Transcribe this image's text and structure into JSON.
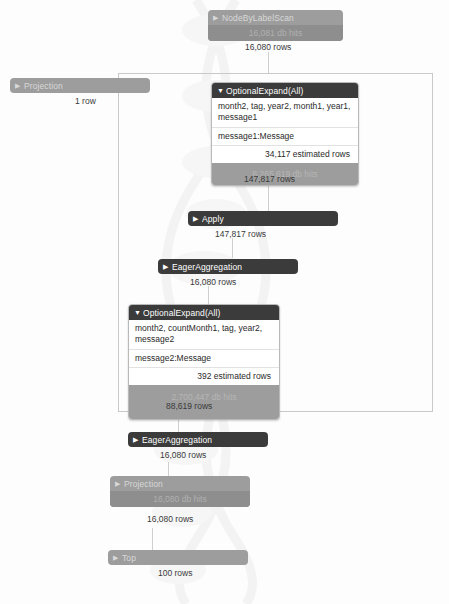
{
  "diagram": {
    "frame_label": "apply-subtree-boundary"
  },
  "operators": [
    {
      "id": "node-by-label-scan",
      "name": "NodeByLabelScan",
      "caret": "▶",
      "state": "collapsed",
      "style": "gray",
      "db_hits": "16,081 db hits",
      "rows": "16,080 rows"
    },
    {
      "id": "projection-left",
      "name": "Projection",
      "caret": "▶",
      "state": "collapsed",
      "style": "gray",
      "db_hits": "",
      "rows": "1 row"
    },
    {
      "id": "optional-expand-all-1",
      "name": "OptionalExpand(All)",
      "caret": "▼",
      "state": "expanded",
      "identifiers": "month2, tag, year2, month1, year1, message1",
      "details": "message1:Message",
      "estimated_rows": "34,117 estimated rows",
      "db_hits": "6,265,619 db hits",
      "rows": "147,817 rows"
    },
    {
      "id": "apply",
      "name": "Apply",
      "caret": "▶",
      "state": "collapsed",
      "style": "dark",
      "db_hits": "",
      "rows": "147,817 rows"
    },
    {
      "id": "eager-aggregation-1",
      "name": "EagerAggregation",
      "caret": "▶",
      "state": "collapsed",
      "style": "dark",
      "db_hits": "",
      "rows": "16,080 rows"
    },
    {
      "id": "optional-expand-all-2",
      "name": "OptionalExpand(All)",
      "caret": "▼",
      "state": "expanded",
      "identifiers": "month2, countMonth1, tag, year2, message2",
      "details": "message2:Message",
      "estimated_rows": "392 estimated rows",
      "db_hits": "2,700,447 db hits",
      "rows": "88,619 rows"
    },
    {
      "id": "eager-aggregation-2",
      "name": "EagerAggregation",
      "caret": "▶",
      "state": "collapsed",
      "style": "dark",
      "db_hits": "",
      "rows": "16,080 rows"
    },
    {
      "id": "projection-bottom",
      "name": "Projection",
      "caret": "▶",
      "state": "collapsed",
      "style": "gray",
      "db_hits": "16,080 db hits",
      "rows": "16,080 rows"
    },
    {
      "id": "top",
      "name": "Top",
      "caret": "▶",
      "state": "collapsed",
      "style": "gray",
      "db_hits": "",
      "rows": "100 rows"
    }
  ],
  "colors": {
    "dark_operator": "#3b3b3b",
    "gray_operator": "#9d9d9d",
    "db_hit_bar": "#8e8e8e",
    "frame_border": "#c9c9c9",
    "text_dark": "#2a2a2a",
    "text_light": "#ffffff",
    "background": "#fdfdfd"
  }
}
